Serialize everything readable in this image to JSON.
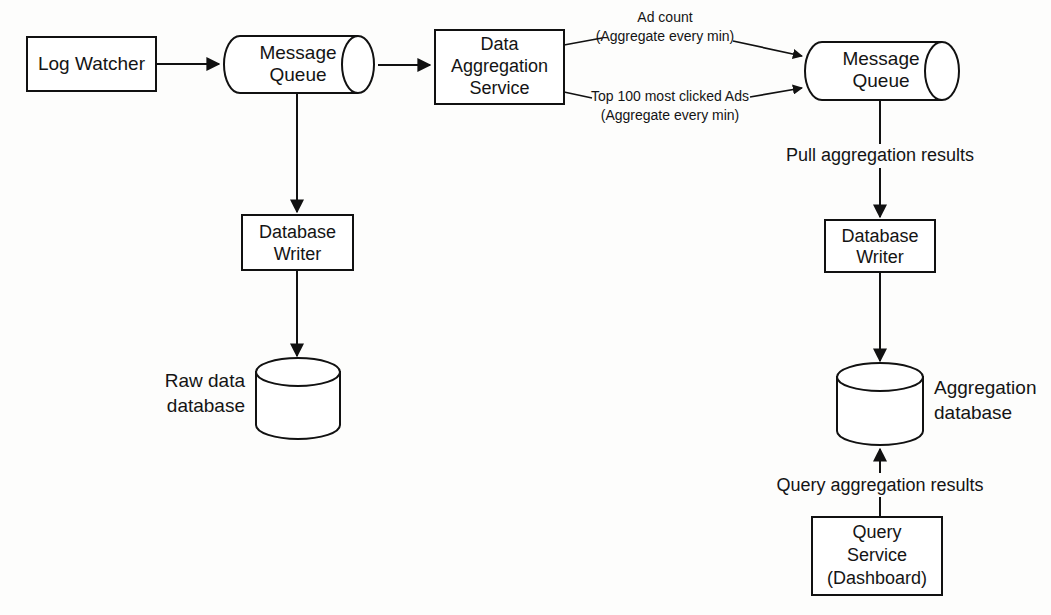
{
  "diagram": {
    "type": "system-architecture-flow",
    "nodes": [
      {
        "id": "log-watcher",
        "shape": "rect",
        "label": "Log Watcher"
      },
      {
        "id": "message-queue-1",
        "shape": "cylinder-h",
        "label_line1": "Message",
        "label_line2": "Queue"
      },
      {
        "id": "data-aggregation-service",
        "shape": "rect",
        "label_line1": "Data",
        "label_line2": "Aggregation",
        "label_line3": "Service"
      },
      {
        "id": "message-queue-2",
        "shape": "cylinder-h",
        "label_line1": "Message",
        "label_line2": "Queue"
      },
      {
        "id": "database-writer-raw",
        "shape": "rect",
        "label_line1": "Database",
        "label_line2": "Writer"
      },
      {
        "id": "raw-data-database",
        "shape": "cylinder-v",
        "label_line1": "Raw data",
        "label_line2": "database"
      },
      {
        "id": "database-writer-agg",
        "shape": "rect",
        "label_line1": "Database",
        "label_line2": "Writer"
      },
      {
        "id": "aggregation-database",
        "shape": "cylinder-v",
        "label_line1": "Aggregation",
        "label_line2": "database"
      },
      {
        "id": "query-service",
        "shape": "rect",
        "label_line1": "Query",
        "label_line2": "Service",
        "label_line3": "(Dashboard)"
      }
    ],
    "edges": [
      {
        "id": "e1",
        "from": "log-watcher",
        "to": "message-queue-1",
        "label": ""
      },
      {
        "id": "e2",
        "from": "message-queue-1",
        "to": "data-aggregation-service",
        "label": ""
      },
      {
        "id": "e3",
        "from": "message-queue-1",
        "to": "database-writer-raw",
        "label": ""
      },
      {
        "id": "e4",
        "from": "database-writer-raw",
        "to": "raw-data-database",
        "label": ""
      },
      {
        "id": "e5",
        "from": "data-aggregation-service",
        "to": "message-queue-2",
        "label_line1": "Ad count",
        "label_line2": "(Aggregate every min)"
      },
      {
        "id": "e6",
        "from": "data-aggregation-service",
        "to": "message-queue-2",
        "label_line1": "Top 100 most clicked Ads",
        "label_line2": "(Aggregate every min)"
      },
      {
        "id": "e7",
        "from": "message-queue-2",
        "to": "database-writer-agg",
        "label": "Pull aggregation results"
      },
      {
        "id": "e8",
        "from": "database-writer-agg",
        "to": "aggregation-database",
        "label": ""
      },
      {
        "id": "e9",
        "from": "query-service",
        "to": "aggregation-database",
        "label": "Query aggregation results"
      }
    ],
    "colors": {
      "stroke": "#111111",
      "fill": "#ffffff",
      "background": "#fdfdfc",
      "text": "#141414"
    }
  }
}
